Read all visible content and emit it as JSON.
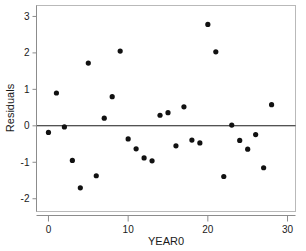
{
  "chart_data": {
    "type": "scatter",
    "title": "",
    "xlabel": "YEAR0",
    "ylabel": "Residuals",
    "xlim": [
      -1.5,
      31.0
    ],
    "ylim": [
      -2.35,
      3.3
    ],
    "xticks": [
      0,
      10,
      20,
      30
    ],
    "xtick_labels": [
      "0",
      "10",
      "20",
      "30"
    ],
    "yticks": [
      -2,
      -1,
      0,
      1,
      2,
      3
    ],
    "ytick_labels": [
      "-2",
      "-1",
      "0",
      "1",
      "2",
      "3"
    ],
    "grid": false,
    "legend": null,
    "reference_line": {
      "orientation": "horizontal",
      "value": 0,
      "color": "#1a1a1a"
    },
    "marker": {
      "shape": "circle",
      "color": "#111111",
      "size": 4.6
    },
    "x": [
      0,
      1,
      2,
      3,
      4,
      5,
      6,
      7,
      8,
      9,
      10,
      11,
      12,
      13,
      14,
      15,
      16,
      17,
      18,
      19,
      20,
      21,
      22,
      23,
      24,
      25,
      26,
      27,
      28
    ],
    "y": [
      -0.18,
      0.9,
      -0.03,
      -0.95,
      -1.7,
      1.72,
      -1.37,
      0.21,
      0.8,
      2.05,
      -0.36,
      -0.63,
      -0.88,
      -0.96,
      0.29,
      0.36,
      -0.55,
      0.52,
      -0.39,
      -0.47,
      2.78,
      2.03,
      -1.39,
      0.02,
      -0.4,
      -0.64,
      -0.24,
      -1.15,
      0.58
    ],
    "points": [
      {
        "x": 0,
        "y": -0.18
      },
      {
        "x": 1,
        "y": 0.9
      },
      {
        "x": 2,
        "y": -0.03
      },
      {
        "x": 3,
        "y": -0.95
      },
      {
        "x": 4,
        "y": -1.7
      },
      {
        "x": 5,
        "y": 1.72
      },
      {
        "x": 6,
        "y": -1.37
      },
      {
        "x": 7,
        "y": 0.21
      },
      {
        "x": 8,
        "y": 0.8
      },
      {
        "x": 9,
        "y": 2.05
      },
      {
        "x": 10,
        "y": -0.36
      },
      {
        "x": 11,
        "y": -0.63
      },
      {
        "x": 12,
        "y": -0.88
      },
      {
        "x": 13,
        "y": -0.96
      },
      {
        "x": 14,
        "y": 0.29
      },
      {
        "x": 15,
        "y": 0.36
      },
      {
        "x": 16,
        "y": -0.55
      },
      {
        "x": 17,
        "y": 0.52
      },
      {
        "x": 18,
        "y": -0.39
      },
      {
        "x": 19,
        "y": -0.47
      },
      {
        "x": 20,
        "y": 2.78
      },
      {
        "x": 21,
        "y": 2.03
      },
      {
        "x": 22,
        "y": -1.39
      },
      {
        "x": 23,
        "y": 0.02
      },
      {
        "x": 24,
        "y": -0.4
      },
      {
        "x": 25,
        "y": -0.64
      },
      {
        "x": 26,
        "y": -0.24
      },
      {
        "x": 27,
        "y": -1.15
      },
      {
        "x": 28,
        "y": 0.58
      }
    ],
    "n_points": 29
  },
  "colors": {
    "marker": "#111111",
    "frame": "#b9b9b9",
    "axis_line": "#8c8c8c",
    "reference_line": "#1a1a1a",
    "background": "#ffffff",
    "text": "#1a1a1a"
  },
  "axes": {
    "y_axis_title": "Residuals",
    "x_axis_title": "YEAR0"
  }
}
